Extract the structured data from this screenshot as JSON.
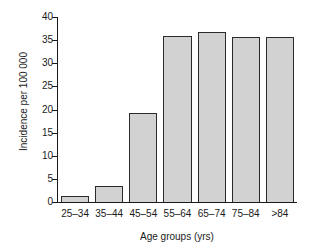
{
  "chart_data": {
    "type": "bar",
    "title": "",
    "subtitle": "",
    "xlabel": "Age groups (yrs)",
    "ylabel": "Incidence per 100 000",
    "categories": [
      "25–34",
      "35–44",
      "45–54",
      "55–64",
      "65–74",
      "75–84",
      ">84"
    ],
    "values": [
      1.2,
      3.5,
      19.3,
      36.0,
      36.8,
      35.6,
      35.6
    ],
    "ylim": [
      0,
      40
    ],
    "yticks": [
      0,
      5,
      10,
      15,
      20,
      25,
      30,
      35,
      40
    ],
    "ytick_labels": [
      "0",
      "5",
      "10",
      "15",
      "20",
      "25",
      "30",
      "35",
      "40"
    ],
    "grid": false,
    "legend": null,
    "legend_position": "none",
    "annotations": [],
    "bar_fill_color": "#d2d2d2",
    "bar_edge_color": "#2b2b2b",
    "axis_color": "#1a1a1a",
    "background_color": "#ffffff"
  }
}
